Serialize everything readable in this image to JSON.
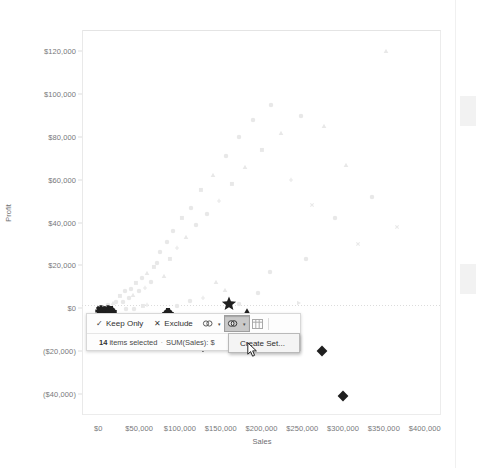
{
  "app": {
    "name": "tableau-scatter-plot-view"
  },
  "chart_data": {
    "type": "scatter",
    "title": "",
    "xlabel": "Sales",
    "ylabel": "Profit",
    "xlim": [
      -20000,
      420000
    ],
    "ylim": [
      -50000,
      130000
    ],
    "xticks": [
      "$0",
      "$50,000",
      "$100,000",
      "$150,000",
      "$200,000",
      "$250,000",
      "$300,000",
      "$350,000",
      "$400,000"
    ],
    "xtick_values": [
      0,
      50000,
      100000,
      150000,
      200000,
      250000,
      300000,
      350000,
      400000
    ],
    "yticks": [
      "$120,000",
      "$100,000",
      "$80,000",
      "$60,000",
      "$40,000",
      "$20,000",
      "$0",
      "($20,000)",
      "($40,000)"
    ],
    "ytick_values": [
      120000,
      100000,
      80000,
      60000,
      40000,
      20000,
      0,
      -20000,
      -40000
    ],
    "grid": false,
    "legend": "none",
    "selected_count": 14,
    "series": [
      {
        "name": "selected",
        "color": "#1f1f1f",
        "points": [
          {
            "x": 3000,
            "y": -1500,
            "shape": "asterisk"
          },
          {
            "x": 4500,
            "y": -3500,
            "shape": "asterisk"
          },
          {
            "x": 12000,
            "y": -1200,
            "shape": "asterisk"
          },
          {
            "x": 13500,
            "y": -4200,
            "shape": "asterisk"
          },
          {
            "x": 15000,
            "y": -2000,
            "shape": "plus-circle"
          },
          {
            "x": 86000,
            "y": -3000,
            "shape": "plus-circle"
          },
          {
            "x": 160000,
            "y": 1800,
            "shape": "star"
          },
          {
            "x": 182000,
            "y": -2500,
            "shape": "triangle"
          },
          {
            "x": 205000,
            "y": -8000,
            "shape": "diamond"
          },
          {
            "x": 128000,
            "y": -18000,
            "shape": "heart"
          },
          {
            "x": 274000,
            "y": -20000,
            "shape": "diamond"
          },
          {
            "x": 300000,
            "y": -41000,
            "shape": "diamond"
          },
          {
            "x": 150000,
            "y": -17500,
            "shape": "heart"
          },
          {
            "x": 232000,
            "y": -9500,
            "shape": "diamond"
          }
        ]
      },
      {
        "name": "unselected",
        "color": "#e8e8e8",
        "points": [
          {
            "x": 12000,
            "y": 1500,
            "shape": "circle"
          },
          {
            "x": 18000,
            "y": 2200,
            "shape": "triangle"
          },
          {
            "x": 22000,
            "y": 3000,
            "shape": "circle"
          },
          {
            "x": 26000,
            "y": 5500,
            "shape": "square"
          },
          {
            "x": 30000,
            "y": 2800,
            "shape": "circle"
          },
          {
            "x": 33000,
            "y": 8200,
            "shape": "circle"
          },
          {
            "x": 37000,
            "y": 4500,
            "shape": "circle"
          },
          {
            "x": 40000,
            "y": 9000,
            "shape": "circle"
          },
          {
            "x": 43000,
            "y": 6200,
            "shape": "triangle"
          },
          {
            "x": 46000,
            "y": 11500,
            "shape": "square"
          },
          {
            "x": 50000,
            "y": 7800,
            "shape": "circle"
          },
          {
            "x": 53000,
            "y": 14000,
            "shape": "circle"
          },
          {
            "x": 57000,
            "y": 9500,
            "shape": "plus"
          },
          {
            "x": 60000,
            "y": 16500,
            "shape": "triangle"
          },
          {
            "x": 64000,
            "y": 12000,
            "shape": "circle"
          },
          {
            "x": 68000,
            "y": 19000,
            "shape": "square"
          },
          {
            "x": 72000,
            "y": 21000,
            "shape": "circle"
          },
          {
            "x": 76000,
            "y": 26000,
            "shape": "circle"
          },
          {
            "x": 80000,
            "y": 15000,
            "shape": "triangle"
          },
          {
            "x": 84000,
            "y": 31000,
            "shape": "circle"
          },
          {
            "x": 88000,
            "y": 23000,
            "shape": "square"
          },
          {
            "x": 92000,
            "y": 36000,
            "shape": "circle"
          },
          {
            "x": 96000,
            "y": 28000,
            "shape": "plus"
          },
          {
            "x": 102000,
            "y": 42000,
            "shape": "square"
          },
          {
            "x": 108000,
            "y": 33000,
            "shape": "triangle"
          },
          {
            "x": 114000,
            "y": 47000,
            "shape": "circle"
          },
          {
            "x": 120000,
            "y": 39000,
            "shape": "circle"
          },
          {
            "x": 126000,
            "y": 55000,
            "shape": "square"
          },
          {
            "x": 133000,
            "y": 44000,
            "shape": "circle"
          },
          {
            "x": 140000,
            "y": 62000,
            "shape": "triangle"
          },
          {
            "x": 148000,
            "y": 50000,
            "shape": "plus"
          },
          {
            "x": 156000,
            "y": 71000,
            "shape": "circle"
          },
          {
            "x": 164000,
            "y": 58000,
            "shape": "square"
          },
          {
            "x": 172000,
            "y": 80000,
            "shape": "circle"
          },
          {
            "x": 180000,
            "y": 66000,
            "shape": "triangle"
          },
          {
            "x": 190000,
            "y": 88000,
            "shape": "circle"
          },
          {
            "x": 200000,
            "y": 74000,
            "shape": "square"
          },
          {
            "x": 212000,
            "y": 95000,
            "shape": "circle"
          },
          {
            "x": 224000,
            "y": 82000,
            "shape": "triangle"
          },
          {
            "x": 236000,
            "y": 60000,
            "shape": "plus"
          },
          {
            "x": 248000,
            "y": 90000,
            "shape": "circle"
          },
          {
            "x": 262000,
            "y": 48000,
            "shape": "x"
          },
          {
            "x": 276000,
            "y": 85000,
            "shape": "triangle"
          },
          {
            "x": 290000,
            "y": 42000,
            "shape": "circle"
          },
          {
            "x": 304000,
            "y": 67000,
            "shape": "triangle"
          },
          {
            "x": 318000,
            "y": 30000,
            "shape": "x"
          },
          {
            "x": 336000,
            "y": 52000,
            "shape": "circle"
          },
          {
            "x": 352000,
            "y": 120000,
            "shape": "triangle"
          },
          {
            "x": 366000,
            "y": 38000,
            "shape": "x"
          },
          {
            "x": 246000,
            "y": 2500,
            "shape": "triangle-right"
          },
          {
            "x": 60000,
            "y": 1200,
            "shape": "plus"
          },
          {
            "x": 96000,
            "y": 1000,
            "shape": "circle"
          },
          {
            "x": 112000,
            "y": 3200,
            "shape": "circle"
          },
          {
            "x": 128000,
            "y": 4800,
            "shape": "plus"
          },
          {
            "x": 172000,
            "y": 2000,
            "shape": "circle"
          },
          {
            "x": 196000,
            "y": 7000,
            "shape": "circle"
          },
          {
            "x": 210000,
            "y": 17000,
            "shape": "circle"
          },
          {
            "x": 255000,
            "y": 23000,
            "shape": "circle"
          },
          {
            "x": 144000,
            "y": 12000,
            "shape": "triangle"
          },
          {
            "x": 155000,
            "y": 8500,
            "shape": "triangle"
          },
          {
            "x": 34000,
            "y": -400,
            "shape": "circle"
          },
          {
            "x": 44000,
            "y": -600,
            "shape": "circle"
          },
          {
            "x": 55000,
            "y": 900,
            "shape": "square"
          }
        ]
      }
    ]
  },
  "tooltip": {
    "keep_only_label": "Keep Only",
    "exclude_label": "Exclude",
    "check_glyph": "✓",
    "x_glyph": "✕",
    "caret_glyph": "▾",
    "icons": [
      {
        "name": "group-members-icon",
        "active": false
      },
      {
        "name": "create-set-icon",
        "active": true
      },
      {
        "name": "view-data-icon",
        "active": false
      }
    ],
    "status_count": "14",
    "status_text": "items selected",
    "status_separator": "·",
    "status_measure": "SUM(Sales): $"
  },
  "context_menu": {
    "items": [
      "Create Set..."
    ]
  },
  "colors": {
    "selected": "#1f1f1f",
    "unselected": "#e8e8e8",
    "axis_text": "#77787a",
    "frame": "#ececec",
    "tooltip_bg": "#fdfdfd",
    "menu_bg": "#f4f4f4",
    "active_button": "#c9c9c9"
  }
}
